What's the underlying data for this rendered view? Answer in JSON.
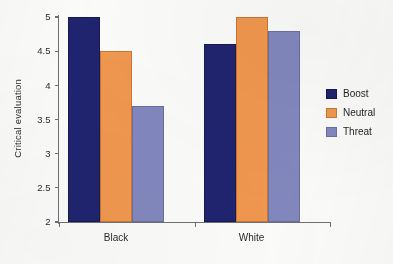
{
  "chart_data": {
    "type": "bar",
    "title": "",
    "xlabel": "",
    "ylabel": "Critical evaluation",
    "categories": [
      "Black",
      "White"
    ],
    "series": [
      {
        "name": "Boost",
        "color": "#20246f",
        "values": [
          5.0,
          4.6
        ]
      },
      {
        "name": "Neutral",
        "color": "#f0974f",
        "values": [
          4.5,
          5.0
        ]
      },
      {
        "name": "Threat",
        "color": "#8287bd",
        "values": [
          3.7,
          4.8
        ]
      }
    ],
    "ylim": [
      2,
      5
    ],
    "yticks": [
      2,
      2.5,
      3,
      3.5,
      4,
      4.5,
      5
    ],
    "ytick_labels": [
      "2",
      "2.5",
      "3",
      "3.5",
      "4",
      "4.5",
      "5"
    ],
    "grid": false,
    "legend_position": "right"
  },
  "colors": {
    "background": "#fbfbfa",
    "axis": "#6f6f78",
    "text": "#2b2b2b"
  }
}
